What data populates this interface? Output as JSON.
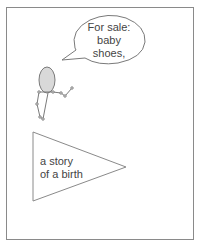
{
  "panel": {
    "speech_bubble": {
      "lines": [
        "For sale:",
        "baby",
        "shoes,"
      ]
    },
    "triangle_caption": {
      "lines": [
        "a story",
        "of a birth"
      ]
    },
    "colors": {
      "frame": "#8a8a8a",
      "stroke": "#7a7a7a",
      "head_fill": "#d9d9d9",
      "text": "#444444"
    }
  }
}
